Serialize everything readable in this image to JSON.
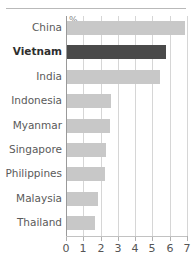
{
  "chart_data": {
    "type": "bar",
    "orientation": "horizontal",
    "title": "",
    "subtitle": "",
    "xlabel": "",
    "ylabel": "",
    "unit_label": "%",
    "xlim": [
      0,
      7
    ],
    "xticks": [
      0,
      1,
      2,
      3,
      4,
      5,
      6,
      7
    ],
    "xtick_labels": [
      "0",
      "1",
      "2",
      "3",
      "4",
      "5",
      "6",
      "7"
    ],
    "grid": "vertical",
    "legend": "none",
    "categories": [
      "China",
      "Vietnam",
      "India",
      "Indonesia",
      "Myanmar",
      "Singapore",
      "Philippines",
      "Malaysia",
      "Thailand"
    ],
    "values": [
      6.8,
      5.7,
      5.4,
      2.55,
      2.5,
      2.25,
      2.2,
      1.8,
      1.6
    ],
    "highlight_category": "Vietnam",
    "colors": {
      "bar": "#c8c8c8",
      "bar_highlight": "#4a4a4a",
      "gridline": "#d6d6d6",
      "axis": "#9a9a9a",
      "text": "#5a5a5a",
      "rule": "#b9b9b9"
    }
  }
}
